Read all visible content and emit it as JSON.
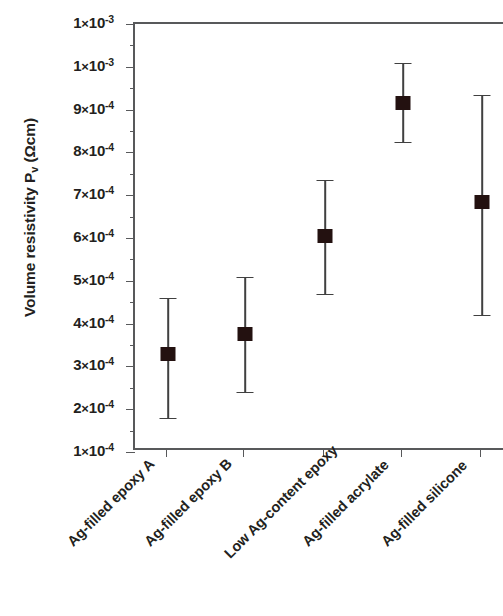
{
  "chart_data": {
    "type": "scatter",
    "title": "",
    "xlabel": "",
    "ylabel": "Volume resistivity P_v (Ωcm)",
    "ylabel_main": "Volume resistivity P",
    "ylabel_sub": "v",
    "ylabel_unit": " (Ωcm)",
    "categories": [
      "Ag-filled epoxy A",
      "Ag-filled epoxy B",
      "Low Ag-content epoxy",
      "Ag-filled acrylate",
      "Ag-filled silicone"
    ],
    "values": [
      0.00033,
      0.000375,
      0.000605,
      0.000915,
      0.000685
    ],
    "error_low": [
      0.00018,
      0.00024,
      0.00047,
      0.000825,
      0.00042
    ],
    "error_high": [
      0.00046,
      0.00051,
      0.000735,
      0.00101,
      0.000935
    ],
    "ylim": [
      0.0001,
      0.0011
    ],
    "ytick_values": [
      0.0011,
      0.001,
      0.0009,
      0.0008,
      0.0007,
      0.0006,
      0.0005,
      0.0004,
      0.0003,
      0.0002,
      0.0001
    ],
    "ytick_labels": [
      {
        "mantissa": "1",
        "exponent": "-3"
      },
      {
        "mantissa": "1",
        "exponent": "-3"
      },
      {
        "mantissa": "9",
        "exponent": "-4"
      },
      {
        "mantissa": "8",
        "exponent": "-4"
      },
      {
        "mantissa": "7",
        "exponent": "-4"
      },
      {
        "mantissa": "6",
        "exponent": "-4"
      },
      {
        "mantissa": "5",
        "exponent": "-4"
      },
      {
        "mantissa": "4",
        "exponent": "-4"
      },
      {
        "mantissa": "3",
        "exponent": "-4"
      },
      {
        "mantissa": "2",
        "exponent": "-4"
      },
      {
        "mantissa": "1",
        "exponent": "-4"
      }
    ],
    "minor_ticks_between": 1,
    "grid": false,
    "legend": null,
    "marker_shape": "filled-square",
    "marker_color": "#231110",
    "errorbar_color": "#404040",
    "axis_color": "#58595b",
    "background_color": "#ffffff",
    "multiply_sign": "×",
    "base": "10"
  }
}
